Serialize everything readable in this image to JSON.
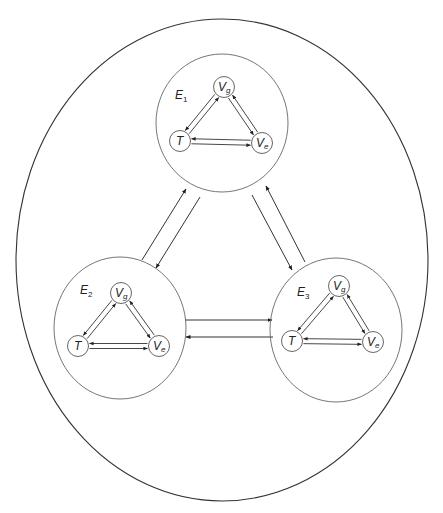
{
  "outer": {
    "cx": 222,
    "cy": 260,
    "rx": 206,
    "ry": 241
  },
  "clusters": [
    {
      "id": "E1",
      "label": "E",
      "sub": "1",
      "cx": 222,
      "cy": 123,
      "rx": 66,
      "ry": 69,
      "label_pos": [
        175,
        99
      ],
      "nodes": {
        "Vg": {
          "x": 224,
          "y": 87,
          "label": "V",
          "sub": "g"
        },
        "T": {
          "x": 180,
          "y": 141,
          "label": "T",
          "sub": ""
        },
        "Ve": {
          "x": 262,
          "y": 143,
          "label": "V",
          "sub": "e"
        }
      }
    },
    {
      "id": "E2",
      "label": "E",
      "sub": "2",
      "cx": 120,
      "cy": 328,
      "rx": 66,
      "ry": 71,
      "label_pos": [
        80,
        294
      ],
      "nodes": {
        "Vg": {
          "x": 121,
          "y": 293,
          "label": "V",
          "sub": "g"
        },
        "T": {
          "x": 78,
          "y": 346,
          "label": "T",
          "sub": ""
        },
        "Ve": {
          "x": 159,
          "y": 346,
          "label": "V",
          "sub": "e"
        }
      }
    },
    {
      "id": "E3",
      "label": "E",
      "sub": "3",
      "cx": 336,
      "cy": 330,
      "rx": 66,
      "ry": 72,
      "label_pos": [
        297,
        296
      ],
      "nodes": {
        "Vg": {
          "x": 339,
          "y": 286,
          "label": "V",
          "sub": "g"
        },
        "T": {
          "x": 292,
          "y": 341,
          "label": "T",
          "sub": ""
        },
        "Ve": {
          "x": 373,
          "y": 342,
          "label": "V",
          "sub": "e"
        }
      }
    }
  ],
  "node_radius": 10.5,
  "inner_edges": [
    {
      "from": "T",
      "to": "Vg",
      "offset": -2.5
    },
    {
      "from": "Vg",
      "to": "T",
      "offset": -2.5
    },
    {
      "from": "Vg",
      "to": "Ve",
      "offset": -2.5
    },
    {
      "from": "Ve",
      "to": "Vg",
      "offset": -2.5
    },
    {
      "from": "T",
      "to": "Ve",
      "offset": -2.5
    },
    {
      "from": "Ve",
      "to": "T",
      "offset": -2.5
    }
  ],
  "cluster_links": [
    {
      "name": "E2-to-E1",
      "x1": 142,
      "y1": 260,
      "x2": 186,
      "y2": 189
    },
    {
      "name": "E1-to-E2",
      "x1": 200,
      "y1": 197,
      "x2": 156,
      "y2": 268
    },
    {
      "name": "E1-to-E3",
      "x1": 252,
      "y1": 195,
      "x2": 292,
      "y2": 270
    },
    {
      "name": "E3-to-E1",
      "x1": 305,
      "y1": 262,
      "x2": 266,
      "y2": 186
    },
    {
      "name": "E2-to-E3",
      "x1": 185,
      "y1": 320,
      "x2": 272,
      "y2": 320
    },
    {
      "name": "E3-to-E2",
      "x1": 273,
      "y1": 337,
      "x2": 186,
      "y2": 337
    }
  ],
  "colors": {
    "stroke": "#333333",
    "node_stroke": "#555555",
    "background": "#ffffff"
  }
}
